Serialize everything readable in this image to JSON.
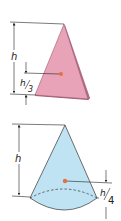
{
  "figures": [
    {
      "name": "triangle-plate",
      "fill": "#e8a3b8",
      "edge_fill": "#b06d85",
      "height_label": "h",
      "centroid_label": "h/3",
      "centroid_label_num": "h",
      "centroid_label_den": "3"
    },
    {
      "name": "cone",
      "fill": "#bfe3f3",
      "height_label": "h",
      "centroid_label": "h/4",
      "centroid_label_num": "h",
      "centroid_label_den": "4"
    }
  ],
  "colors": {
    "centroid_dot": "#e8703a",
    "line": "#222222"
  }
}
